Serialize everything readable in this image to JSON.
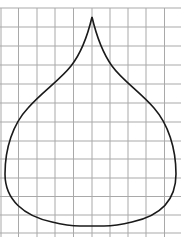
{
  "figure": {
    "width": 181,
    "height": 237,
    "background_color": "#ffffff",
    "grid": {
      "color": "#a9a9a9",
      "stroke_width": 1,
      "vertical_lines_x": [
        1,
        18.5,
        37,
        55,
        73.5,
        92,
        110,
        128,
        146,
        164.5
      ],
      "horizontal_lines_y": [
        8,
        27,
        46,
        65,
        84,
        103,
        122,
        141,
        159,
        178,
        196.5,
        215,
        233
      ],
      "cell_size_px": 18.4
    },
    "shape": {
      "name": "onion-dome-outline",
      "stroke_color": "#1a1a1a",
      "stroke_width": 1.6,
      "fill": "none",
      "tip": {
        "x": 92,
        "y": 17
      },
      "left_extreme": {
        "x": 5,
        "y": 177
      },
      "right_extreme": {
        "x": 176,
        "y": 177
      },
      "bottom_y": 226,
      "path": "M92,17 C96,34 102,52 112,66 C122,80 140,92 154,108 C168,124 176,148 176,174 C176,200 160,216 132,222 C124,224 116,226 104,226 L80,226 C68,226 60,224 52,222 C24,216 5,200 5,174 C5,148 13,124 28,108 C42,92 60,80 71,66 C82,52 88,34 92,17 Z"
    }
  }
}
